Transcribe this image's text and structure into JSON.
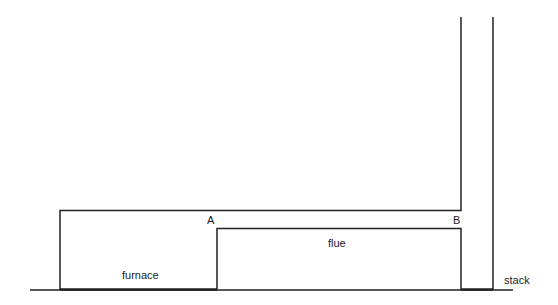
{
  "diagram": {
    "type": "schematic",
    "labels": {
      "furnace": "furnace",
      "flue": "flue",
      "stack": "stack",
      "point_a": "A",
      "point_b": "B"
    },
    "colors": {
      "line": "#222222",
      "background": "#ffffff"
    }
  }
}
